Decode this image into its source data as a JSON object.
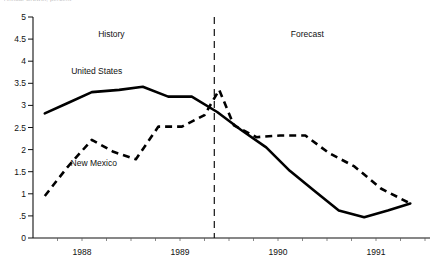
{
  "title_clipped": "Annual Growth, percent",
  "chart_data": {
    "type": "line",
    "title": "",
    "xlabel": "",
    "ylabel": "",
    "ylim": [
      0,
      5
    ],
    "xlim": [
      1987.5,
      1991.5
    ],
    "grid": false,
    "legend_position": "inline-labels",
    "yticks": [
      "0",
      ".5",
      "1",
      "1.5",
      "2",
      "2.5",
      "3",
      "3.5",
      "4",
      "4.5",
      "5"
    ],
    "ytick_values": [
      0,
      0.5,
      1,
      1.5,
      2,
      2.5,
      3,
      3.5,
      4,
      4.5,
      5
    ],
    "xticks": [
      "1988",
      "1989",
      "1990",
      "1991"
    ],
    "xtick_values": [
      1988,
      1989,
      1990,
      1991
    ],
    "annotations": [
      {
        "text": "History",
        "x": 1988.3,
        "y": 4.55
      },
      {
        "text": "Forecast",
        "x": 1990.3,
        "y": 4.55
      }
    ],
    "divider": {
      "x": 1989.35,
      "style": "dashed",
      "label": "history-forecast-divider"
    },
    "series": [
      {
        "name": "United States",
        "style": "solid",
        "label_x": 1988.15,
        "label_y": 3.72,
        "x": [
          1987.62,
          1987.85,
          1988.1,
          1988.38,
          1988.62,
          1988.88,
          1989.12,
          1989.38,
          1989.62,
          1989.88,
          1990.12,
          1990.38,
          1990.62,
          1990.88,
          1991.12,
          1991.35
        ],
        "values": [
          2.82,
          3.05,
          3.3,
          3.35,
          3.42,
          3.2,
          3.2,
          2.85,
          2.45,
          2.05,
          1.52,
          1.05,
          0.62,
          0.47,
          0.62,
          0.78
        ]
      },
      {
        "name": "New Mexico",
        "style": "dashed",
        "label_x": 1988.12,
        "label_y": 1.62,
        "x": [
          1987.62,
          1987.85,
          1988.1,
          1988.32,
          1988.55,
          1988.78,
          1989.02,
          1989.25,
          1989.4,
          1989.55,
          1989.78,
          1990.02,
          1990.28,
          1990.52,
          1990.78,
          1991.05,
          1991.35
        ],
        "values": [
          0.95,
          1.6,
          2.22,
          1.95,
          1.78,
          2.52,
          2.52,
          2.78,
          3.35,
          2.55,
          2.28,
          2.32,
          2.32,
          1.92,
          1.62,
          1.12,
          0.78
        ]
      }
    ]
  },
  "colors": {
    "line": "#000000",
    "axis": "#111111",
    "background": "#ffffff"
  }
}
